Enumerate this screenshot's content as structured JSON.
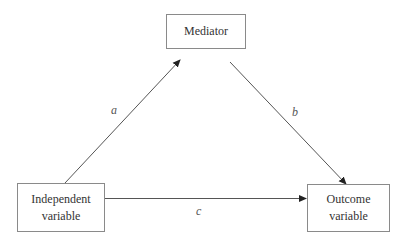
{
  "diagram": {
    "type": "mediation-model",
    "nodes": {
      "mediator": {
        "label": "Mediator"
      },
      "independent": {
        "label": "Independent\nvariable"
      },
      "outcome": {
        "label": "Outcome\nvariable"
      }
    },
    "edges": [
      {
        "from": "independent",
        "to": "mediator",
        "label": "a"
      },
      {
        "from": "mediator",
        "to": "outcome",
        "label": "b"
      },
      {
        "from": "independent",
        "to": "outcome",
        "label": "c"
      }
    ],
    "colors": {
      "line": "#555555",
      "box_border": "#8a8a8a",
      "text": "#333333"
    }
  }
}
